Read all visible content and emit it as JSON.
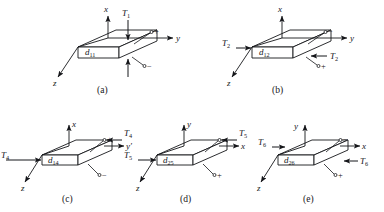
{
  "figure": {
    "kind": "piezoelectric-coefficient-diagram",
    "background_color": "#ffffff",
    "line_color": "#15161a",
    "plate_face_color": "#ffffff",
    "panel_count": 5
  },
  "panels": [
    {
      "id": "a",
      "caption": "(a)",
      "coefficient": "d",
      "coefficient_sub": "11",
      "axes": [
        {
          "name": "x",
          "dir": "up"
        },
        {
          "name": "y",
          "dir": "right"
        },
        {
          "name": "z",
          "dir": "down-left"
        }
      ],
      "stress": {
        "symbol": "T",
        "sub": "1",
        "mode": "longitudinal-compression",
        "arrows": [
          "down-top",
          "up-bottom"
        ],
        "labels": [
          "T1"
        ]
      },
      "terminals": [
        {
          "sign": "+",
          "position": "top-right"
        },
        {
          "sign": "−",
          "position": "bottom-right"
        }
      ]
    },
    {
      "id": "b",
      "caption": "(b)",
      "coefficient": "d",
      "coefficient_sub": "12",
      "axes": [
        {
          "name": "x",
          "dir": "up"
        },
        {
          "name": "y",
          "dir": "right"
        },
        {
          "name": "z",
          "dir": "down-left"
        }
      ],
      "stress": {
        "symbol": "T",
        "sub": "2",
        "mode": "transverse-compression",
        "arrows": [
          "right-left-edge",
          "left-right-edge"
        ],
        "labels": [
          "T2",
          "T2"
        ]
      },
      "terminals": [
        {
          "sign": "−",
          "position": "top-right"
        },
        {
          "sign": "+",
          "position": "bottom-right"
        }
      ]
    },
    {
      "id": "c",
      "caption": "(c)",
      "coefficient": "d",
      "coefficient_sub": "14",
      "axes": [
        {
          "name": "x",
          "dir": "up"
        },
        {
          "name": "y′",
          "dir": "right"
        },
        {
          "name": "z",
          "dir": "down-left"
        }
      ],
      "stress": {
        "symbol": "T",
        "sub": "4",
        "mode": "shear",
        "arrows": [
          "right-left-edge",
          "left-right-edge"
        ],
        "labels": [
          "T4",
          "T4"
        ]
      },
      "terminals": [
        {
          "sign": "+",
          "position": "top-right"
        },
        {
          "sign": "−",
          "position": "bottom-right"
        }
      ]
    },
    {
      "id": "d",
      "caption": "(d)",
      "coefficient": "d",
      "coefficient_sub": "25",
      "axes": [
        {
          "name": "y",
          "dir": "up"
        },
        {
          "name": "x",
          "dir": "right"
        },
        {
          "name": "z",
          "dir": "down-left"
        }
      ],
      "stress": {
        "symbol": "T",
        "sub": "5",
        "mode": "shear",
        "arrows": [
          "right-left-edge",
          "left-right-edge"
        ],
        "labels": [
          "T5",
          "T5"
        ]
      },
      "terminals": [
        {
          "sign": "−",
          "position": "top-right"
        },
        {
          "sign": "+",
          "position": "bottom-right"
        }
      ]
    },
    {
      "id": "e",
      "caption": "(e)",
      "coefficient": "d",
      "coefficient_sub": "26",
      "axes": [
        {
          "name": "y",
          "dir": "up"
        },
        {
          "name": "x",
          "dir": "right"
        },
        {
          "name": "z",
          "dir": "down-left"
        }
      ],
      "stress": {
        "symbol": "T",
        "sub": "6",
        "mode": "shear",
        "arrows": [
          "right-left-edge",
          "left-right-edge"
        ],
        "labels": [
          "T6",
          "T6"
        ]
      },
      "terminals": [
        {
          "sign": "−",
          "position": "top-right"
        },
        {
          "sign": "+",
          "position": "bottom-right"
        }
      ]
    }
  ],
  "text": {
    "T": "T",
    "d": "d",
    "plus": "+",
    "minus": "−",
    "axis_x": "x",
    "axis_y": "y",
    "axis_yprime": "y′",
    "axis_z": "z",
    "cap_a": "(a)",
    "cap_b": "(b)",
    "cap_c": "(c)",
    "cap_d": "(d)",
    "cap_e": "(e)",
    "sub_1": "1",
    "sub_2": "2",
    "sub_4": "4",
    "sub_5": "5",
    "sub_6": "6",
    "sub_11": "11",
    "sub_12": "12",
    "sub_14": "14",
    "sub_25": "25",
    "sub_26": "26"
  }
}
